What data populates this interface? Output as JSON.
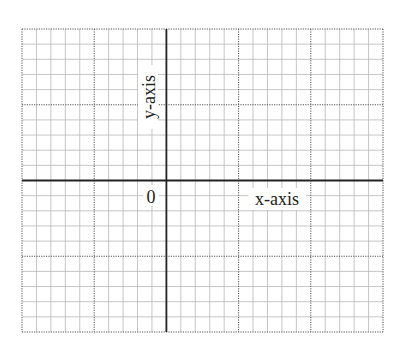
{
  "diagram": {
    "type": "coordinate-grid",
    "grid": {
      "columns": 25,
      "rows": 20,
      "major_every": 5,
      "left": 22,
      "top": 29,
      "right": 383,
      "bottom": 332,
      "minor_color": "#b8b8b8",
      "major_color": "#555555",
      "axis_color": "#222222"
    },
    "axes": {
      "origin_column": 10,
      "origin_row": 10,
      "x_label": "x-axis",
      "y_label": "y-axis",
      "origin_label": "0"
    }
  }
}
